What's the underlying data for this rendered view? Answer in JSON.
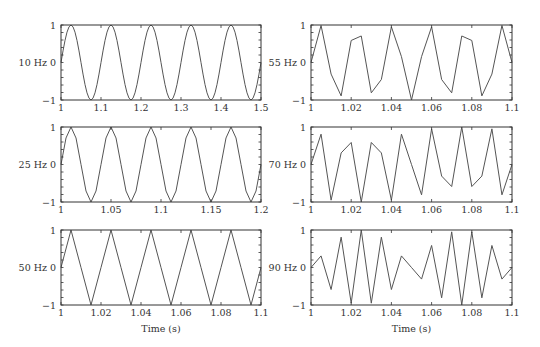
{
  "chart_data": [
    {
      "type": "line",
      "panel": "left-top",
      "ylabel": "10 Hz",
      "freq": 10,
      "sample_rate": 200,
      "xlim": [
        1,
        1.5
      ],
      "ylim": [
        -1,
        1
      ],
      "xticks": [
        1,
        1.1,
        1.2,
        1.3,
        1.4,
        1.5
      ],
      "xtick_labels": [
        "1",
        "1.1",
        "1.2",
        "1.3",
        "1.4",
        "1.5"
      ],
      "yticks": [
        -1,
        0,
        1
      ],
      "ytick_labels": [
        "−1",
        "0",
        "1"
      ],
      "xlabel": ""
    },
    {
      "type": "line",
      "panel": "left-middle",
      "ylabel": "25 Hz",
      "freq": 25,
      "sample_rate": 200,
      "xlim": [
        1,
        1.2
      ],
      "ylim": [
        -1,
        1
      ],
      "xticks": [
        1,
        1.05,
        1.1,
        1.15,
        1.2
      ],
      "xtick_labels": [
        "1",
        "1.05",
        "1.1",
        "1.15",
        "1.2"
      ],
      "yticks": [
        -1,
        0,
        1
      ],
      "ytick_labels": [
        "−1",
        "0",
        "1"
      ],
      "xlabel": ""
    },
    {
      "type": "line",
      "panel": "left-bottom",
      "ylabel": "50 Hz",
      "freq": 50,
      "sample_rate": 200,
      "xlim": [
        1,
        1.1
      ],
      "ylim": [
        -1,
        1
      ],
      "xticks": [
        1,
        1.02,
        1.04,
        1.06,
        1.08,
        1.1
      ],
      "xtick_labels": [
        "1",
        "1.02",
        "1.04",
        "1.06",
        "1.08",
        "1.1"
      ],
      "yticks": [
        -1,
        0,
        1
      ],
      "ytick_labels": [
        "−1",
        "0",
        "1"
      ],
      "xlabel": "Time (s)"
    },
    {
      "type": "line",
      "panel": "right-top",
      "ylabel": "55 Hz",
      "freq": 55,
      "sample_rate": 200,
      "xlim": [
        1,
        1.1
      ],
      "ylim": [
        -1,
        1
      ],
      "xticks": [
        1,
        1.02,
        1.04,
        1.06,
        1.08,
        1.1
      ],
      "xtick_labels": [
        "1",
        "1.02",
        "1.04",
        "1.06",
        "1.08",
        "1.1"
      ],
      "yticks": [
        -1,
        0,
        1
      ],
      "ytick_labels": [
        "−1",
        "0",
        "1"
      ],
      "xlabel": ""
    },
    {
      "type": "line",
      "panel": "right-middle",
      "ylabel": "70 Hz",
      "freq": 70,
      "sample_rate": 200,
      "xlim": [
        1,
        1.1
      ],
      "ylim": [
        -1,
        1
      ],
      "xticks": [
        1,
        1.02,
        1.04,
        1.06,
        1.08,
        1.1
      ],
      "xtick_labels": [
        "1",
        "1.02",
        "1.04",
        "1.06",
        "1.08",
        "1.1"
      ],
      "yticks": [
        -1,
        0,
        1
      ],
      "ytick_labels": [
        "−1",
        "0",
        "1"
      ],
      "xlabel": ""
    },
    {
      "type": "line",
      "panel": "right-bottom",
      "ylabel": "90 Hz",
      "freq": 90,
      "sample_rate": 200,
      "xlim": [
        1,
        1.1
      ],
      "ylim": [
        -1,
        1
      ],
      "xticks": [
        1,
        1.02,
        1.04,
        1.06,
        1.08,
        1.1
      ],
      "xtick_labels": [
        "1",
        "1.02",
        "1.04",
        "1.06",
        "1.08",
        "1.1"
      ],
      "yticks": [
        -1,
        0,
        1
      ],
      "ytick_labels": [
        "−1",
        "0",
        "1"
      ],
      "xlabel": "Time (s)"
    }
  ],
  "layout": {
    "columns_x": [
      [
        61,
        261
      ],
      [
        311,
        512
      ]
    ],
    "rows_y": [
      [
        25,
        100
      ],
      [
        127,
        202
      ],
      [
        230,
        305
      ]
    ],
    "line_color": "#555555",
    "frame_color": "#333333"
  }
}
